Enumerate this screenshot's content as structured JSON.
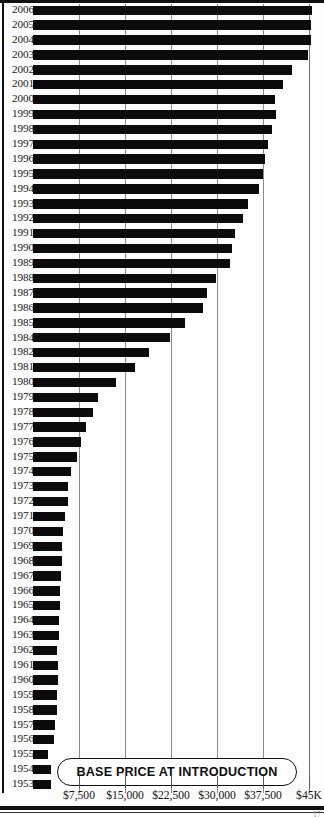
{
  "banner": {
    "title": "BASE PRICE AT INTRODUCTION"
  },
  "footer": {
    "page": "17"
  },
  "chart_data": {
    "type": "bar",
    "orientation": "horizontal",
    "title": "BASE PRICE AT INTRODUCTION",
    "xlabel": "",
    "ylabel": "",
    "xlim": [
      0,
      45000
    ],
    "grid": true,
    "legend": false,
    "axis_ticks": [
      {
        "value": 7500,
        "label": "$7,500"
      },
      {
        "value": 15000,
        "label": "$15,000"
      },
      {
        "value": 22500,
        "label": "$22,500"
      },
      {
        "value": 30000,
        "label": "$30,000"
      },
      {
        "value": 37500,
        "label": "$37,500"
      },
      {
        "value": 45000,
        "label": "$45K"
      }
    ],
    "bar_color": "#0b0b0b",
    "categories": [
      "2006",
      "2005",
      "2004",
      "2003",
      "2002",
      "2001",
      "2000",
      "1999",
      "1998",
      "1997",
      "1996",
      "1995",
      "1994",
      "1993",
      "1992",
      "1991",
      "1990",
      "1989",
      "1988",
      "1987",
      "1986",
      "1985",
      "1984",
      "1982",
      "1981",
      "1980",
      "1979",
      "1978",
      "1977",
      "1976",
      "1975",
      "1974",
      "1973",
      "1972",
      "1971",
      "1970",
      "1969",
      "1968",
      "1967",
      "1966",
      "1965",
      "1964",
      "1963",
      "1962",
      "1961",
      "1960",
      "1959",
      "1958",
      "1957",
      "1956",
      "1955",
      "1954",
      "1953"
    ],
    "values": [
      45500,
      45300,
      45400,
      44800,
      42200,
      40800,
      39400,
      39600,
      38900,
      38300,
      37900,
      37500,
      36800,
      35000,
      34200,
      32900,
      32400,
      32100,
      29800,
      28300,
      27700,
      24800,
      22300,
      18900,
      16600,
      13500,
      10600,
      9800,
      8600,
      7800,
      7200,
      6200,
      5700,
      5700,
      5200,
      4900,
      4700,
      4700,
      4600,
      4400,
      4400,
      4200,
      4200,
      3900,
      4100,
      4100,
      3900,
      3900,
      3600,
      3400,
      2500,
      2900,
      2900
    ]
  }
}
